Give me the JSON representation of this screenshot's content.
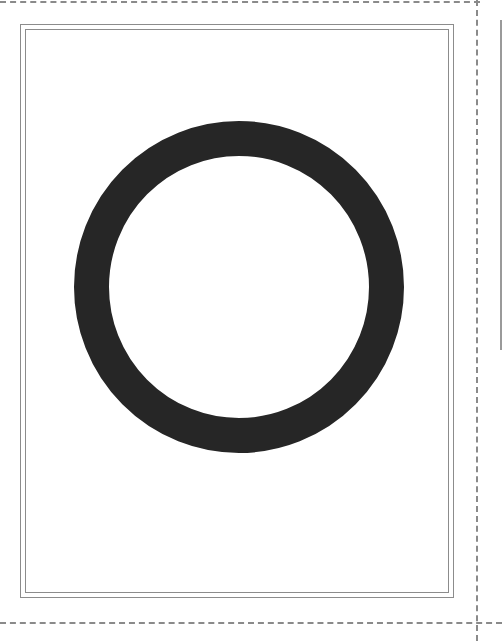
{
  "card": {
    "glyph": {
      "shape": "ring",
      "semantic": "letter-O",
      "fill_color": "#262626",
      "center_x": 239,
      "center_y": 287,
      "outer_radius_x": 165,
      "outer_radius_y": 166,
      "stroke_width": 35
    },
    "frame_color": "#8c8c8c"
  },
  "cut_lines": {
    "color": "#8a8a8a",
    "style": "dashed"
  }
}
